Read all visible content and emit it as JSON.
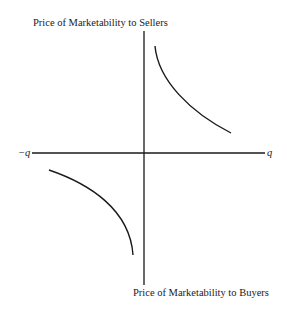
{
  "diagram": {
    "y_axis_top_label": "Price of Marketability to Sellers",
    "y_axis_bottom_label": "Price of Marketability to Buyers",
    "x_axis_left_label": "−q",
    "x_axis_right_label": "q",
    "curves": [
      {
        "name": "sellers-curve",
        "quadrant": "upper-right",
        "shape": "hyperbola-branch"
      },
      {
        "name": "buyers-curve",
        "quadrant": "lower-left",
        "shape": "hyperbola-branch"
      }
    ],
    "colors": {
      "ink": "#1a1a1a",
      "background": "#ffffff"
    }
  }
}
